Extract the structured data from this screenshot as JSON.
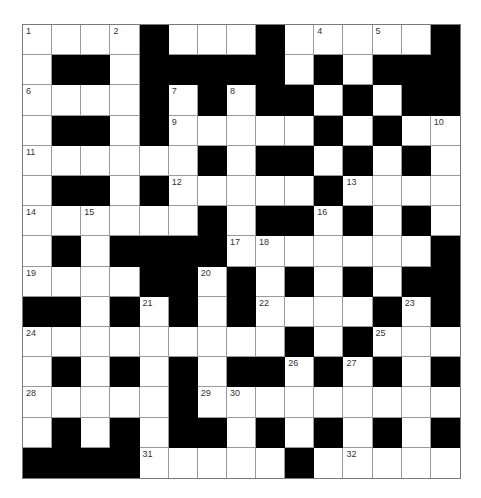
{
  "puzzle": {
    "rows": 15,
    "cols": 15,
    "colors": {
      "block": "#000000",
      "cell": "#ffffff",
      "gridline": "#9a9a9a",
      "number": "#333333"
    },
    "layout": [
      "....#...#.....#",
      ".##.#####.#.###",
      "....#.#.##.#.##",
      ".##.#.....#.#..",
      "......#.##.#.#.",
      ".##.#.....#....",
      "......#.##.#.#.",
      ".#.####.......#",
      "....##.#.#.#.##",
      "##.#.#.#....#.#",
      ".........#.#...",
      ".#.#.#.##.#.#.#",
      ".....#.........",
      ".#.#.##.#.#.#.#",
      "####.....#....."
    ],
    "numbers": [
      {
        "r": 0,
        "c": 0,
        "n": "1"
      },
      {
        "r": 0,
        "c": 3,
        "n": "2"
      },
      {
        "r": 0,
        "c": 8,
        "n": "3"
      },
      {
        "r": 0,
        "c": 10,
        "n": "4"
      },
      {
        "r": 0,
        "c": 12,
        "n": "5"
      },
      {
        "r": 2,
        "c": 0,
        "n": "6"
      },
      {
        "r": 2,
        "c": 5,
        "n": "7"
      },
      {
        "r": 2,
        "c": 7,
        "n": "8"
      },
      {
        "r": 3,
        "c": 5,
        "n": "9"
      },
      {
        "r": 3,
        "c": 14,
        "n": "10"
      },
      {
        "r": 4,
        "c": 0,
        "n": "11"
      },
      {
        "r": 5,
        "c": 5,
        "n": "12"
      },
      {
        "r": 5,
        "c": 11,
        "n": "13"
      },
      {
        "r": 6,
        "c": 0,
        "n": "14"
      },
      {
        "r": 6,
        "c": 2,
        "n": "15"
      },
      {
        "r": 6,
        "c": 10,
        "n": "16"
      },
      {
        "r": 7,
        "c": 7,
        "n": "17"
      },
      {
        "r": 7,
        "c": 8,
        "n": "18"
      },
      {
        "r": 8,
        "c": 0,
        "n": "19"
      },
      {
        "r": 8,
        "c": 6,
        "n": "20"
      },
      {
        "r": 9,
        "c": 4,
        "n": "21"
      },
      {
        "r": 9,
        "c": 8,
        "n": "22"
      },
      {
        "r": 9,
        "c": 13,
        "n": "23"
      },
      {
        "r": 10,
        "c": 0,
        "n": "24"
      },
      {
        "r": 10,
        "c": 12,
        "n": "25"
      },
      {
        "r": 11,
        "c": 9,
        "n": "26"
      },
      {
        "r": 11,
        "c": 11,
        "n": "27"
      },
      {
        "r": 12,
        "c": 0,
        "n": "28"
      },
      {
        "r": 12,
        "c": 6,
        "n": "29"
      },
      {
        "r": 12,
        "c": 7,
        "n": "30"
      },
      {
        "r": 14,
        "c": 4,
        "n": "31"
      },
      {
        "r": 14,
        "c": 11,
        "n": "32"
      }
    ],
    "entries": {}
  }
}
